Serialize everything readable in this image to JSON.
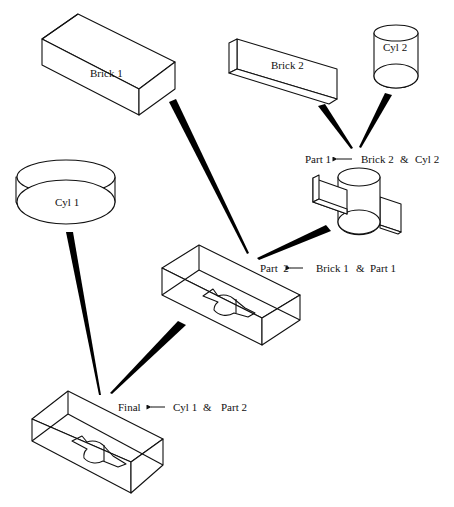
{
  "diagram": {
    "type": "csg-tree",
    "colors": {
      "stroke": "#111111",
      "wedge": "#000000",
      "background": "#ffffff"
    },
    "primitives": [
      {
        "id": "brick1",
        "label": "Brick 1",
        "shape": "box"
      },
      {
        "id": "brick2",
        "label": "Brick 2",
        "shape": "box"
      },
      {
        "id": "cyl1",
        "label": "Cyl 1",
        "shape": "cylinder"
      },
      {
        "id": "cyl2",
        "label": "Cyl 2",
        "shape": "cylinder"
      }
    ],
    "operations": [
      {
        "result": "Part 1",
        "arrow": "←",
        "left": "Brick 2",
        "op": "&",
        "right": "Cyl 2"
      },
      {
        "result": "Part  2",
        "arrow": "←",
        "left": "Brick 1",
        "op": "&",
        "right": "Part 1"
      },
      {
        "result": "Final",
        "arrow": "←",
        "left": "Cyl 1",
        "op": "&",
        "right": "Part 2"
      }
    ]
  }
}
